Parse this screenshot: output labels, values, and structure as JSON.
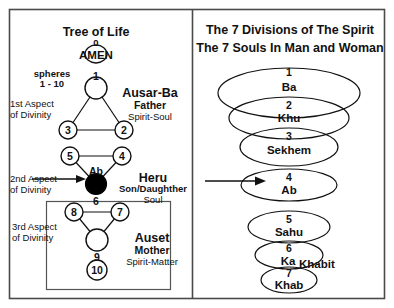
{
  "diagram": {
    "left_panel": {
      "title": "Tree of Life",
      "spheres_note_line1": "spheres",
      "spheres_note_line2": "1 - 10",
      "crown_number": "0",
      "crown_label": "AMEN",
      "aspects": [
        {
          "line1": "1st Aspect",
          "line2": "of Divinity"
        },
        {
          "line1": "2nd Aspect",
          "line2": "of Divinity"
        },
        {
          "line1": "3rd Aspect",
          "line2": "of Divinity"
        }
      ],
      "groups": [
        {
          "name": "Ausar-Ba",
          "role": "Father",
          "nature": "Spirit-Soul"
        },
        {
          "name": "Heru",
          "role": "Son/Daughther",
          "nature": "Soul"
        },
        {
          "name": "Auset",
          "role": "Mother",
          "nature": "Spirit-Matter"
        }
      ],
      "ab_label": "Ab",
      "sphere_numbers": [
        "1",
        "2",
        "3",
        "4",
        "5",
        "6",
        "7",
        "8",
        "9",
        "10"
      ]
    },
    "right_panel": {
      "title_line1": "The 7 Divisions of The Spirit",
      "title_line2": "The 7 Souls In Man and Woman",
      "souls": [
        {
          "number": "1",
          "name": "Ba"
        },
        {
          "number": "2",
          "name": "Khu"
        },
        {
          "number": "3",
          "name": "Sekhem"
        },
        {
          "number": "4",
          "name": "Ab"
        },
        {
          "number": "5",
          "name": "Sahu"
        },
        {
          "number": "6",
          "name": "Ka"
        },
        {
          "number": "7",
          "name": "Khab"
        }
      ],
      "khabit_label": "Khabit"
    },
    "colors": {
      "ink": "#111111",
      "border": "#4a4a4a",
      "filled_sphere": "#000000",
      "background": "#ffffff"
    }
  }
}
